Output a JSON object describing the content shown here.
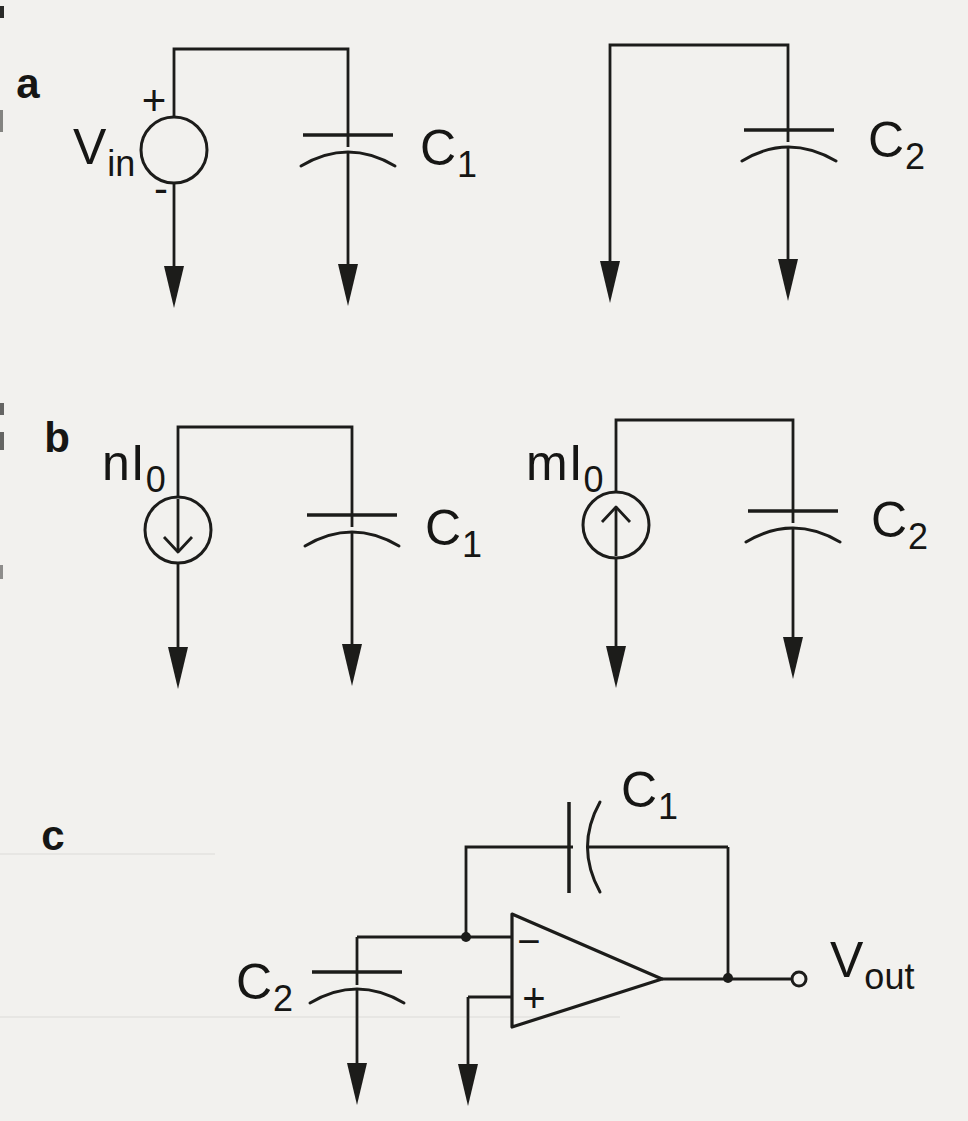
{
  "figure": {
    "type": "circuit-diagram",
    "panels": [
      {
        "id": "a",
        "label": "a",
        "components": {
          "voltage_source": {
            "label_main": "V",
            "label_sub": "in",
            "plus": "+",
            "minus": "-"
          },
          "capacitor_left": {
            "label_main": "C",
            "label_sub": "1"
          },
          "capacitor_right": {
            "label_main": "C",
            "label_sub": "2"
          }
        }
      },
      {
        "id": "b",
        "label": "b",
        "components": {
          "current_source_left": {
            "label_main": "nI",
            "label_sub": "0",
            "direction": "down"
          },
          "capacitor_left": {
            "label_main": "C",
            "label_sub": "1"
          },
          "current_source_right": {
            "label_main": "mI",
            "label_sub": "0",
            "direction": "up"
          },
          "capacitor_right": {
            "label_main": "C",
            "label_sub": "2"
          }
        }
      },
      {
        "id": "c",
        "label": "c",
        "components": {
          "feedback_capacitor": {
            "label_main": "C",
            "label_sub": "1"
          },
          "input_capacitor": {
            "label_main": "C",
            "label_sub": "2"
          },
          "opamp": {
            "inverting_label": "−",
            "noninverting_label": "+"
          },
          "output": {
            "label_main": "V",
            "label_sub": "out"
          }
        }
      }
    ],
    "colors": {
      "ink": "#1c1c1a",
      "paper": "#f2f1ee"
    }
  }
}
